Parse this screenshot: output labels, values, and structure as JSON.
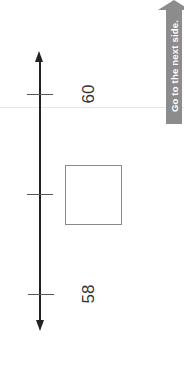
{
  "number_line": {
    "orientation": "vertical",
    "ticks": [
      {
        "position": "top",
        "label": "60"
      },
      {
        "position": "middle",
        "label": ""
      },
      {
        "position": "bottom",
        "label": "58"
      }
    ],
    "answer_box": {
      "value": ""
    }
  },
  "navigation": {
    "next_side_label": "Go to the next side.",
    "icon": "arrow-up-icon"
  },
  "colors": {
    "axis": "#222222",
    "box_border": "#8a8a8a",
    "button_bg": "#8c8c8c",
    "button_text": "#ffffff"
  }
}
